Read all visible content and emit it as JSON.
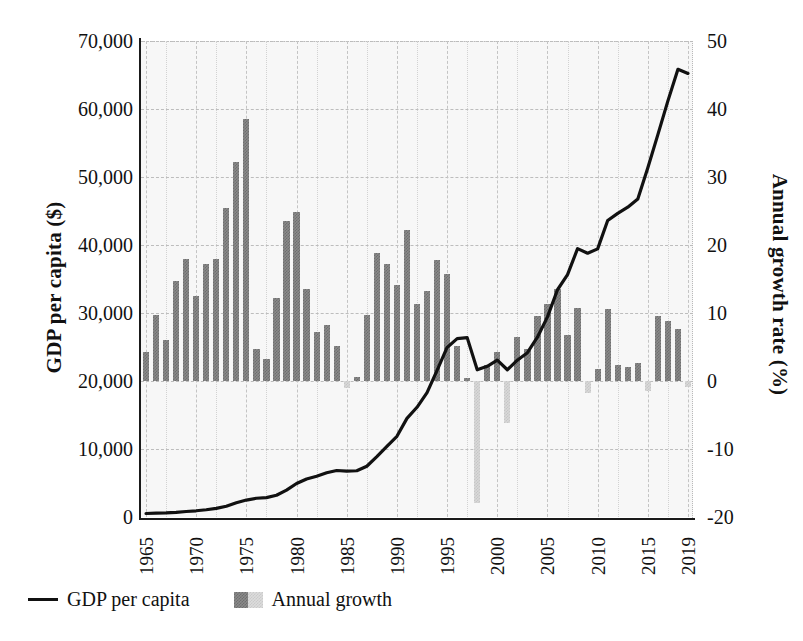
{
  "chart_data": {
    "type": "bar",
    "title": "",
    "xlabel": "",
    "ylabel": "GDP per capita ($)",
    "y2label": "Annual growth rate (%)",
    "ylim": [
      0,
      70000
    ],
    "y2lim": [
      -20,
      50
    ],
    "xlim": [
      1965,
      2019
    ],
    "grid": true,
    "legend_position": "bottom-left",
    "yticks": [
      "0",
      "10,000",
      "20,000",
      "30,000",
      "40,000",
      "50,000",
      "60,000",
      "70,000"
    ],
    "ytick_values": [
      0,
      10000,
      20000,
      30000,
      40000,
      50000,
      60000,
      70000
    ],
    "y2ticks": [
      "-20",
      "-10",
      "0",
      "10",
      "20",
      "30",
      "40",
      "50"
    ],
    "y2tick_values": [
      -20,
      -10,
      0,
      10,
      20,
      30,
      40,
      50
    ],
    "xticks": [
      "1965",
      "1970",
      "1975",
      "1980",
      "1985",
      "1990",
      "1995",
      "2000",
      "2005",
      "2010",
      "2015",
      "2019"
    ],
    "xtick_values": [
      1965,
      1970,
      1975,
      1980,
      1985,
      1990,
      1995,
      2000,
      2005,
      2010,
      2015,
      2019
    ],
    "years": [
      1965,
      1966,
      1967,
      1968,
      1969,
      1970,
      1971,
      1972,
      1973,
      1974,
      1975,
      1976,
      1977,
      1978,
      1979,
      1980,
      1981,
      1982,
      1983,
      1984,
      1985,
      1986,
      1987,
      1988,
      1989,
      1990,
      1991,
      1992,
      1993,
      1994,
      1995,
      1996,
      1997,
      1998,
      1999,
      2000,
      2001,
      2002,
      2003,
      2004,
      2005,
      2006,
      2007,
      2008,
      2009,
      2010,
      2011,
      2012,
      2013,
      2014,
      2015,
      2016,
      2017,
      2018,
      2019
    ],
    "series": [
      {
        "name": "GDP per capita",
        "axis": "left",
        "units": "$",
        "type": "line",
        "color": "#111111",
        "values": [
          516,
          566,
          600,
          688,
          812,
          914,
          1071,
          1264,
          1587,
          2098,
          2491,
          2759,
          2847,
          3194,
          3948,
          4928,
          5598,
          6001,
          6503,
          6835,
          6761,
          6800,
          7463,
          8868,
          10395,
          11864,
          14503,
          16136,
          18290,
          21552,
          24937,
          26233,
          26376,
          21651,
          22160,
          23084,
          21653,
          23063,
          24156,
          26444,
          29435,
          33418,
          35637,
          39468,
          38786,
          39427,
          43595,
          44658,
          45562,
          46777,
          51368,
          56236,
          61193,
          65831,
          65233
        ]
      },
      {
        "name": "Annual growth",
        "axis": "right",
        "units": "%",
        "type": "bar",
        "color_positive": "#7a7a7a",
        "color_negative": "#d6d6d6",
        "values": [
          4.2,
          9.7,
          6.0,
          14.7,
          18.0,
          12.5,
          17.2,
          18.0,
          25.5,
          32.2,
          38.5,
          4.7,
          3.2,
          12.2,
          23.6,
          24.8,
          13.6,
          7.2,
          8.3,
          5.1,
          -1.1,
          0.6,
          9.7,
          18.8,
          17.2,
          14.1,
          22.2,
          11.3,
          13.3,
          17.8,
          15.7,
          5.2,
          0.5,
          -17.9,
          2.4,
          4.2,
          -6.2,
          6.5,
          4.7,
          9.5,
          11.3,
          13.5,
          6.7,
          10.8,
          -1.7,
          1.7,
          10.6,
          2.4,
          2.0,
          2.7,
          -1.4,
          9.5,
          8.8,
          7.6,
          -0.9
        ]
      }
    ],
    "legend": [
      {
        "label": "GDP per capita",
        "marker": "line",
        "color": "#111111"
      },
      {
        "label": "Annual growth",
        "marker": "hatched-swatch",
        "color": "#7a7a7a"
      }
    ]
  }
}
